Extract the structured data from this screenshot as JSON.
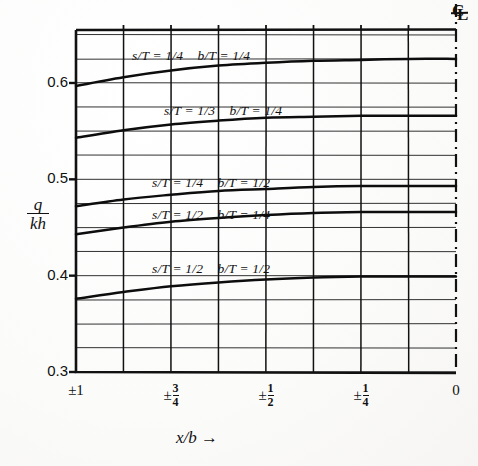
{
  "figure": {
    "title": "",
    "centerline_symbol": "CL"
  },
  "axes": {
    "y_axis_label_numerator": "q",
    "y_axis_label_denominator": "kh",
    "x_axis_label": "x/b",
    "x_axis_arrow": "→",
    "y_tick_labels": [
      "0.6",
      "0.5",
      "0.4",
      "0.3"
    ],
    "y_tick_values": [
      0.6,
      0.5,
      0.4,
      0.3
    ],
    "x_tick_labels": [
      "±1",
      "±3/4",
      "±1/2",
      "±1/4",
      "0"
    ],
    "x_tick_values": [
      1.0,
      0.75,
      0.5,
      0.25,
      0.0
    ]
  },
  "curve_labels": [
    {
      "s_over_T": "s/T = 1/4",
      "b_over_T": "b/T = 1/4"
    },
    {
      "s_over_T": "s/T = 1/3",
      "b_over_T": "b/T = 1/4"
    },
    {
      "s_over_T": "s/T = 1/4",
      "b_over_T": "b/T = 1/2"
    },
    {
      "s_over_T": "s/T = 1/2",
      "b_over_T": "b/T = 1/4"
    },
    {
      "s_over_T": "s/T = 1/2",
      "b_over_T": "b/T = 1/2"
    }
  ],
  "chart_data": {
    "type": "line",
    "title": "",
    "xlabel": "x/b",
    "ylabel": "q/kh",
    "xlim": [
      1.0,
      0.0
    ],
    "ylim": [
      0.3,
      0.655
    ],
    "grid": true,
    "legend": "inline-curve-labels",
    "x_tick_labels": [
      "±1",
      "±3/4",
      "±1/2",
      "±1/4",
      "0"
    ],
    "x_tick_values": [
      1.0,
      0.75,
      0.5,
      0.25,
      0.0
    ],
    "y_tick_labels": [
      "0.3",
      "0.4",
      "0.5",
      "0.6"
    ],
    "y_tick_values": [
      0.3,
      0.4,
      0.5,
      0.6
    ],
    "y_minor_gridline_step": 0.025,
    "x_gridline_count": 9,
    "x": [
      1.0,
      0.875,
      0.75,
      0.625,
      0.5,
      0.375,
      0.25,
      0.125,
      0.0
    ],
    "series": [
      {
        "name": "s/T = 1/4, b/T = 1/4",
        "label": "s/T = 1/4   b/T = 1/4",
        "values": [
          0.597,
          0.606,
          0.613,
          0.618,
          0.621,
          0.623,
          0.624,
          0.625,
          0.625
        ]
      },
      {
        "name": "s/T = 1/3, b/T = 1/4",
        "label": "s/T = 1/3   b/T = 1/4",
        "values": [
          0.543,
          0.551,
          0.557,
          0.561,
          0.564,
          0.565,
          0.566,
          0.566,
          0.566
        ]
      },
      {
        "name": "s/T = 1/4, b/T = 1/2",
        "label": "s/T = 1/4   b/T = 1/2",
        "values": [
          0.472,
          0.479,
          0.484,
          0.488,
          0.49,
          0.492,
          0.493,
          0.493,
          0.493
        ]
      },
      {
        "name": "s/T = 1/2, b/T = 1/4",
        "label": "s/T = 1/2   b/T = 1/4",
        "values": [
          0.443,
          0.45,
          0.456,
          0.46,
          0.463,
          0.465,
          0.466,
          0.466,
          0.466
        ]
      },
      {
        "name": "s/T = 1/2, b/T = 1/2",
        "label": "s/T = 1/2   b/T = 1/2",
        "values": [
          0.376,
          0.383,
          0.389,
          0.393,
          0.396,
          0.398,
          0.399,
          0.399,
          0.399
        ]
      }
    ]
  }
}
